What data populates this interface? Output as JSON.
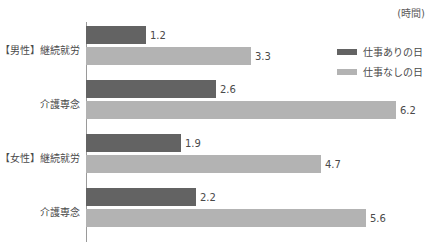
{
  "chart_data": {
    "type": "bar",
    "orientation": "horizontal",
    "title": "",
    "unit_label": "(時間)",
    "xlabel": "",
    "ylabel": "",
    "grid": false,
    "axis_line": true,
    "xlim": [
      0,
      6.9
    ],
    "px_per_unit": 50,
    "legend_position": "top-right",
    "categories": [
      "【男性】継続就労",
      "介護専念",
      "【女性】継続就労",
      "介護専念"
    ],
    "series": [
      {
        "name": "仕事ありの日",
        "color": "#636363",
        "values": [
          1.2,
          2.6,
          1.9,
          2.2
        ],
        "labels": [
          "1.2",
          "2.6",
          "1.9",
          "2.2"
        ]
      },
      {
        "name": "仕事なしの日",
        "color": "#b3b3b3",
        "values": [
          3.3,
          6.2,
          4.7,
          5.6
        ],
        "labels": [
          "3.3",
          "6.2",
          "4.7",
          "5.6"
        ]
      }
    ]
  },
  "legend": {
    "items": [
      {
        "label": "仕事ありの日",
        "color": "#636363"
      },
      {
        "label": "仕事なしの日",
        "color": "#b3b3b3"
      }
    ]
  },
  "colors": {
    "series_dark": "#636363",
    "series_light": "#b3b3b3",
    "axis": "#9a9a9a",
    "text": "#4a4a4a",
    "background": "#ffffff"
  }
}
